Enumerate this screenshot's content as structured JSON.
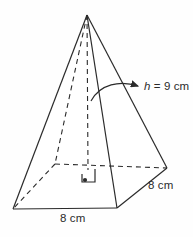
{
  "figure": {
    "name": "square-pyramid-diagram",
    "shape": "square pyramid",
    "background_color": "#fefefe",
    "stroke_color": "#2b2b2b",
    "labels": {
      "height": {
        "symbol": "h",
        "relation": " = 9 cm",
        "full_text": "h = 9 cm",
        "value": 9,
        "unit": "cm",
        "pointer": "curved-arrow-to-apex-axis"
      },
      "depth": {
        "full_text": "8 cm",
        "value": 8,
        "unit": "cm",
        "edge": "base-right-edge"
      },
      "width": {
        "full_text": "8 cm",
        "value": 8,
        "unit": "cm",
        "edge": "base-front-edge"
      }
    },
    "markers": {
      "right_angle": "right-angle-marker-at-base-center",
      "center_point": "base-center-dot"
    },
    "vertices": {
      "apex": [
        87,
        15
      ],
      "base_front_left": [
        13,
        209
      ],
      "base_front_right": [
        117,
        208
      ],
      "base_back_right": [
        167,
        168
      ],
      "base_back_left": [
        55,
        164
      ],
      "base_center": [
        88,
        166
      ]
    },
    "hidden_edges": [
      "apex-to-base-back-left",
      "apex-to-base-center",
      "base-back-left-to-base-front-left",
      "base-back-left-to-base-back-right"
    ]
  }
}
